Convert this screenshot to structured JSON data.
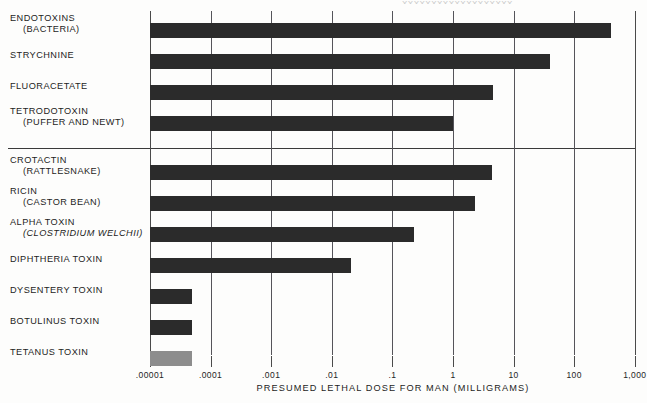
{
  "figure": {
    "top_sliver_text": "XXXXXXXXXXXXXXXXXXX"
  },
  "chart_data": {
    "type": "bar",
    "orientation": "horizontal",
    "title": "",
    "xlabel": "PRESUMED LETHAL DOSE FOR MAN (MILLIGRAMS)",
    "ylabel": "",
    "xscale": "log",
    "xlim": [
      1e-05,
      1000
    ],
    "grid": true,
    "legend": null,
    "xtick_labels": [
      ".00001",
      ".0001",
      ".001",
      ".01",
      ".1",
      "1",
      "10",
      "100",
      "1,000"
    ],
    "xtick_values": [
      1e-05,
      0.0001,
      0.001,
      0.01,
      0.1,
      1,
      10,
      100,
      1000
    ],
    "categories": [
      "ENDOTOXINS (BACTERIA)",
      "STRYCHNINE",
      "FLUORACETATE",
      "TETRODOTOXIN (PUFFER AND NEWT)",
      "CROTACTIN (RATTLESNAKE)",
      "RICIN (CASTOR BEAN)",
      "ALPHA TOXIN (CLOSTRIDIUM WELCHII)",
      "DIPHTHERIA TOXIN",
      "DYSENTERY TOXIN",
      "BOTULINUS TOXIN",
      "TETANUS TOXIN"
    ],
    "values": [
      400,
      40,
      4.5,
      1.0,
      4.4,
      2.3,
      0.23,
      0.021,
      5e-05,
      5e-05,
      5e-05
    ],
    "colors": {
      "bar_dark": "#2b2b2b",
      "bar_light": "#8d8d8d",
      "axis": "#4a4a4a",
      "grid": "#55545a",
      "text": "#1d1d1d",
      "background": "#fdfdfc"
    }
  },
  "rows": [
    {
      "name": "endotoxins",
      "main": "ENDOTOXINS",
      "sub": "(BACTERIA)",
      "sub_italic": false,
      "value": 400,
      "value_label": "400",
      "shade": "dark"
    },
    {
      "name": "strychnine",
      "main": "STRYCHNINE",
      "sub": "",
      "sub_italic": false,
      "value": 40,
      "value_label": "40",
      "shade": "dark"
    },
    {
      "name": "fluoracetate",
      "main": "FLUORACETATE",
      "sub": "",
      "sub_italic": false,
      "value": 4.5,
      "value_label": "4.5",
      "shade": "dark"
    },
    {
      "name": "tetrodotoxin",
      "main": "TETRODOTOXIN",
      "sub": "(PUFFER AND NEWT)",
      "sub_italic": false,
      "value": 1.0,
      "value_label": "1",
      "shade": "dark"
    },
    {
      "name": "crotactin",
      "main": "CROTACTIN",
      "sub": "(RATTLESNAKE)",
      "sub_italic": false,
      "value": 4.4,
      "value_label": "4.4",
      "shade": "dark"
    },
    {
      "name": "ricin",
      "main": "RICIN",
      "sub": "(CASTOR BEAN)",
      "sub_italic": false,
      "value": 2.3,
      "value_label": "2.3",
      "shade": "dark"
    },
    {
      "name": "alpha-toxin",
      "main": "ALPHA TOXIN",
      "sub": "(CLOSTRIDIUM WELCHII)",
      "sub_italic": true,
      "value": 0.23,
      "value_label": ".23",
      "shade": "dark"
    },
    {
      "name": "diphtheria",
      "main": "DIPHTHERIA TOXIN",
      "sub": "",
      "sub_italic": false,
      "value": 0.021,
      "value_label": ".021",
      "shade": "dark"
    },
    {
      "name": "dysentery",
      "main": "DYSENTERY TOXIN",
      "sub": "",
      "sub_italic": false,
      "value": 5e-05,
      "value_label": ".00005",
      "shade": "dark"
    },
    {
      "name": "botulinus",
      "main": "BOTULINUS TOXIN",
      "sub": "",
      "sub_italic": false,
      "value": 5e-05,
      "value_label": ".00005",
      "shade": "dark"
    },
    {
      "name": "tetanus",
      "main": "TETANUS TOXIN",
      "sub": "",
      "sub_italic": false,
      "value": 5e-05,
      "value_label": ".00005",
      "shade": "light"
    }
  ]
}
